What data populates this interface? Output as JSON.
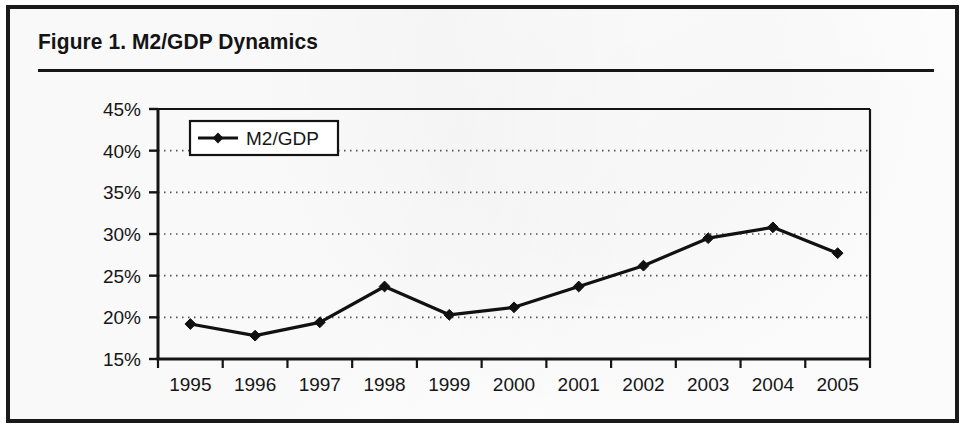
{
  "figure": {
    "title": "Figure 1.  M2/GDP Dynamics"
  },
  "chart_data": {
    "type": "line",
    "title": "Figure 1.  M2/GDP Dynamics",
    "xlabel": "",
    "ylabel": "",
    "categories": [
      "1995",
      "1996",
      "1997",
      "1998",
      "1999",
      "2000",
      "2001",
      "2002",
      "2003",
      "2004",
      "2005"
    ],
    "series": [
      {
        "name": "M2/GDP",
        "values": [
          19.2,
          17.8,
          19.4,
          23.7,
          20.3,
          21.2,
          23.7,
          26.2,
          29.5,
          30.8,
          27.7
        ],
        "marker": "diamond",
        "color": "#111111"
      }
    ],
    "ylim": [
      15,
      45
    ],
    "ytick_values": [
      15,
      20,
      25,
      30,
      35,
      40,
      45
    ],
    "ytick_labels": [
      "15%",
      "20%",
      "25%",
      "30%",
      "35%",
      "40%",
      "45%"
    ],
    "xtick_labels": [
      "1995",
      "1996",
      "1997",
      "1998",
      "1999",
      "2000",
      "2001",
      "2002",
      "2003",
      "2004",
      "2005"
    ],
    "grid": "horizontal-dotted",
    "legend_position": "top-left",
    "legend_entries": [
      "M2/GDP"
    ]
  },
  "legend": {
    "entry_label": "M2/GDP"
  },
  "axis": {
    "y_labels": [
      "45%",
      "40%",
      "35%",
      "30%",
      "25%",
      "20%",
      "15%"
    ],
    "x_labels": [
      "1995",
      "1996",
      "1997",
      "1998",
      "1999",
      "2000",
      "2001",
      "2002",
      "2003",
      "2004",
      "2005"
    ]
  },
  "colors": {
    "border": "#1a1a1a",
    "ink": "#141414",
    "series": "#111111",
    "grid": "#555555",
    "background": "#ffffff"
  }
}
